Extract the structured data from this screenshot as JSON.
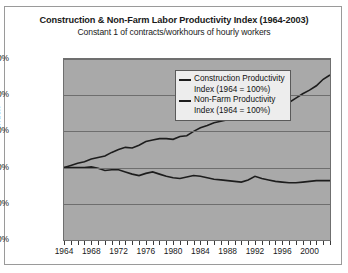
{
  "chart_data": {
    "type": "line",
    "title": "Construction & Non-Farm Labor Productivity Index (1964-2003)",
    "subtitle": "Constant 1 of contracts/workhours of hourly workers",
    "xlabel": "",
    "ylabel": "Index",
    "ylim": [
      0,
      250
    ],
    "xlim": [
      1964,
      2003
    ],
    "ytick_labels": [
      "250.00%",
      "200.00%",
      "150.00%",
      "100.00%",
      "50.00%",
      "0.00%"
    ],
    "ytick_values": [
      250,
      200,
      150,
      100,
      50,
      0
    ],
    "xtick_labels": [
      "1964",
      "1968",
      "1972",
      "1976",
      "1980",
      "1984",
      "1988",
      "1992",
      "1996",
      "2000"
    ],
    "xtick_values": [
      1964,
      1968,
      1972,
      1976,
      1980,
      1984,
      1988,
      1992,
      1996,
      2000
    ],
    "grid": true,
    "legend_position": "center-right",
    "plot_background": "#a9a9a9",
    "line_color": "#1d1d1d",
    "x": [
      1964,
      1965,
      1966,
      1967,
      1968,
      1969,
      1970,
      1971,
      1972,
      1973,
      1974,
      1975,
      1976,
      1977,
      1978,
      1979,
      1980,
      1981,
      1982,
      1983,
      1984,
      1985,
      1986,
      1987,
      1988,
      1989,
      1990,
      1991,
      1992,
      1993,
      1994,
      1995,
      1996,
      1997,
      1998,
      1999,
      2000,
      2001,
      2002,
      2003
    ],
    "series": [
      {
        "name": "Construction Productivity Index (1964 = 100%)",
        "values": [
          100,
          100,
          100,
          100,
          101,
          99,
          96,
          97,
          97,
          94,
          91,
          89,
          92,
          94,
          91,
          88,
          86,
          85,
          87,
          89,
          88,
          86,
          84,
          83,
          82,
          81,
          80,
          83,
          88,
          85,
          83,
          81,
          80,
          79,
          79,
          80,
          81,
          82,
          82,
          82
        ]
      },
      {
        "name": "Non-Farm Productivity Index (1964 = 100%)",
        "values": [
          100,
          103,
          106,
          108,
          112,
          114,
          116,
          121,
          125,
          128,
          127,
          131,
          136,
          138,
          140,
          140,
          139,
          143,
          144,
          150,
          155,
          158,
          162,
          164,
          166,
          167,
          169,
          171,
          176,
          178,
          180,
          181,
          185,
          190,
          196,
          202,
          207,
          213,
          222,
          228
        ]
      }
    ]
  },
  "legend": {
    "entries": [
      "Construction Productivity",
      "Index (1964 = 100%)",
      "Non-Farm Productivity",
      "Index (1964 = 100%)"
    ]
  }
}
